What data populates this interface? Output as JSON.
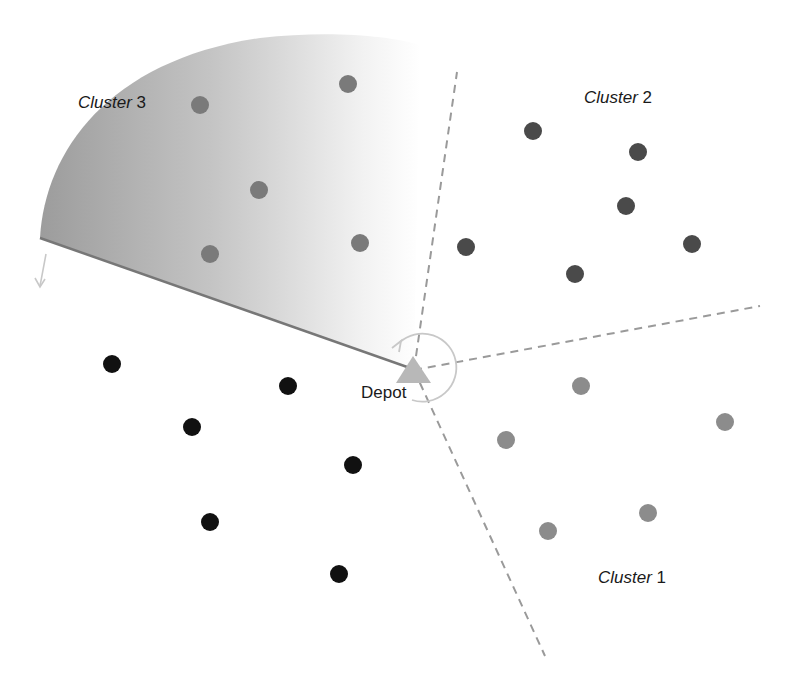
{
  "diagram": {
    "depot": {
      "label": "Depot",
      "x": 414,
      "y": 370,
      "color": "#b8b8b8"
    },
    "clusters": [
      {
        "name": "Cluster",
        "number": "1",
        "label_x": 598,
        "label_y": 568,
        "color": "#8c8c8c",
        "points": [
          [
            581,
            386
          ],
          [
            506,
            440
          ],
          [
            725,
            422
          ],
          [
            648,
            513
          ],
          [
            548,
            531
          ]
        ]
      },
      {
        "name": "Cluster",
        "number": "2",
        "label_x": 584,
        "label_y": 58,
        "color": "#4a4a4a",
        "points": [
          [
            533,
            131
          ],
          [
            638,
            152
          ],
          [
            626,
            206
          ],
          [
            466,
            247
          ],
          [
            575,
            274
          ],
          [
            692,
            244
          ]
        ]
      },
      {
        "name": "Cluster",
        "number": "3",
        "label_x": 78,
        "label_y": 93,
        "color": "#7a7a7a",
        "points": [
          [
            200,
            105
          ],
          [
            348,
            84
          ],
          [
            259,
            190
          ],
          [
            210,
            254
          ],
          [
            360,
            243
          ]
        ]
      },
      {
        "name": "Unassigned",
        "number": "",
        "color": "#111111",
        "points": [
          [
            112,
            364
          ],
          [
            288,
            386
          ],
          [
            192,
            427
          ],
          [
            353,
            465
          ],
          [
            210,
            522
          ],
          [
            339,
            574
          ]
        ]
      }
    ],
    "colors": {
      "dashed_line": "#9a9a9a",
      "sweep_edge": "#777777",
      "sector_dark": "#9c9c9c",
      "arrow": "#c8c8c8"
    }
  }
}
